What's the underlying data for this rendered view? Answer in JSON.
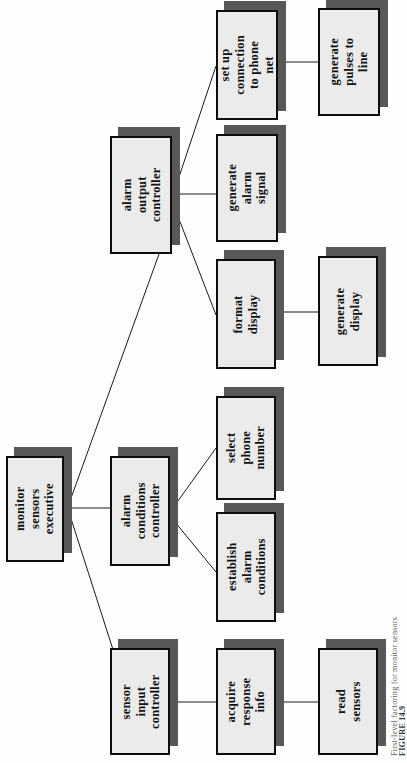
{
  "figure": {
    "kind": "structure-chart",
    "orientation": "rotated-90-ccw",
    "caption_label": "FIGURE 14.9",
    "caption_text": "First-level factoring for monitor sensors",
    "colors": {
      "page_background": "#fefefe",
      "box_fill": "#ebebeb",
      "box_border": "#0d0d0d",
      "box_shadow": "#585858",
      "connector": "#1a1a1a",
      "caption_text": "#5d5d5d"
    }
  },
  "nodes": {
    "root": {
      "id": "monitor-sensors-executive",
      "label": "monitor\nsensors\nexecutive",
      "level": 0
    },
    "alarm_output_controller": {
      "id": "alarm-output-controller",
      "label": "alarm\noutput\ncontroller",
      "level": 1
    },
    "alarm_conditions_controller": {
      "id": "alarm-conditions-controller",
      "label": "alarm\nconditions\ncontroller",
      "level": 1
    },
    "sensor_input_controller": {
      "id": "sensor-input-controller",
      "label": "sensor\ninput\ncontroller",
      "level": 1
    },
    "set_up_connection": {
      "id": "set-up-connection-to-phone-net",
      "label": "set up\nconnection\nto phone net",
      "level": 2
    },
    "generate_alarm_signal": {
      "id": "generate-alarm-signal",
      "label": "generate\nalarm\nsignal",
      "level": 2
    },
    "format_display": {
      "id": "format-display",
      "label": "format\ndisplay",
      "level": 2
    },
    "select_phone_number": {
      "id": "select-phone-number",
      "label": "select\nphone\nnumber",
      "level": 2
    },
    "establish_alarm_conditions": {
      "id": "establish-alarm-conditions",
      "label": "establish\nalarm\nconditions",
      "level": 2
    },
    "acquire_response_info": {
      "id": "acquire-response-info",
      "label": "acquire\nresponse\ninfo",
      "level": 2
    },
    "generate_pulses_to_line": {
      "id": "generate-pulses-to-line",
      "label": "generate\npulses to line",
      "level": 3
    },
    "generate_display": {
      "id": "generate-display",
      "label": "generate\ndisplay",
      "level": 3
    },
    "read_sensors": {
      "id": "read-sensors",
      "label": "read\nsensors",
      "level": 3
    }
  },
  "edges": [
    {
      "from": "monitor-sensors-executive",
      "to": "alarm-output-controller"
    },
    {
      "from": "monitor-sensors-executive",
      "to": "alarm-conditions-controller"
    },
    {
      "from": "monitor-sensors-executive",
      "to": "sensor-input-controller"
    },
    {
      "from": "alarm-output-controller",
      "to": "set-up-connection-to-phone-net"
    },
    {
      "from": "alarm-output-controller",
      "to": "generate-alarm-signal"
    },
    {
      "from": "alarm-output-controller",
      "to": "format-display"
    },
    {
      "from": "alarm-conditions-controller",
      "to": "select-phone-number"
    },
    {
      "from": "alarm-conditions-controller",
      "to": "establish-alarm-conditions"
    },
    {
      "from": "sensor-input-controller",
      "to": "acquire-response-info"
    },
    {
      "from": "set-up-connection-to-phone-net",
      "to": "generate-pulses-to-line"
    },
    {
      "from": "format-display",
      "to": "generate-display"
    },
    {
      "from": "acquire-response-info",
      "to": "read-sensors"
    }
  ]
}
